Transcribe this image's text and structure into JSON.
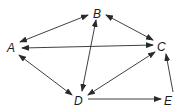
{
  "diagram": {
    "type": "directed-graph",
    "colors": {
      "stroke": "#2a2a2a",
      "label": "#1a1a1a",
      "background": "#ffffff"
    },
    "nodes": [
      {
        "id": "A",
        "label": "A",
        "x": 11,
        "y": 48
      },
      {
        "id": "B",
        "label": "B",
        "x": 97,
        "y": 14
      },
      {
        "id": "C",
        "label": "C",
        "x": 161,
        "y": 47
      },
      {
        "id": "D",
        "label": "D",
        "x": 78,
        "y": 101
      },
      {
        "id": "E",
        "label": "E",
        "x": 168,
        "y": 101
      }
    ],
    "edges": [
      {
        "from": "A",
        "to": "B",
        "bidirectional": true
      },
      {
        "from": "B",
        "to": "C",
        "bidirectional": true
      },
      {
        "from": "A",
        "to": "C",
        "bidirectional": true
      },
      {
        "from": "A",
        "to": "D",
        "bidirectional": true
      },
      {
        "from": "B",
        "to": "D",
        "bidirectional": true
      },
      {
        "from": "C",
        "to": "D",
        "bidirectional": true
      },
      {
        "from": "D",
        "to": "E",
        "bidirectional": false
      },
      {
        "from": "E",
        "to": "C",
        "bidirectional": false
      }
    ]
  }
}
